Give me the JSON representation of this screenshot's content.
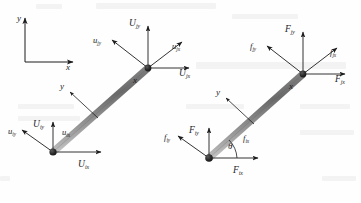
{
  "figure": {
    "type": "structural-element-diagram",
    "background_color": "#fefefe",
    "ink_color": "#1d1d1d",
    "beam_color_dark": "#6b6b6b",
    "beam_color_light": "#d8d8d8"
  },
  "global_axes": {
    "name": "global-coordinate-system",
    "x_label": "x",
    "y_label": "y"
  },
  "left_panel": {
    "name": "displacement-diagram",
    "local_axes": {
      "x_label": "x",
      "y_label": "y"
    },
    "node_j": {
      "name": "upper-node-j",
      "vectors": [
        {
          "id": "Ujy",
          "symbol": "U",
          "sub": "jy",
          "case": "capital",
          "dir": "up"
        },
        {
          "id": "Ujx",
          "symbol": "U",
          "sub": "jx",
          "case": "capital",
          "dir": "right"
        },
        {
          "id": "ujy",
          "symbol": "u",
          "sub": "jy",
          "case": "lower",
          "dir": "up-left"
        },
        {
          "id": "ujx",
          "symbol": "u",
          "sub": "jx",
          "case": "lower",
          "dir": "up-right"
        }
      ]
    },
    "node_i": {
      "name": "lower-node-i",
      "vectors": [
        {
          "id": "Uiy",
          "symbol": "U",
          "sub": "iy",
          "case": "capital",
          "dir": "up"
        },
        {
          "id": "Uix",
          "symbol": "U",
          "sub": "ix",
          "case": "capital",
          "dir": "right"
        },
        {
          "id": "uiy",
          "symbol": "u",
          "sub": "iy",
          "case": "lower",
          "dir": "up-left"
        },
        {
          "id": "uix",
          "symbol": "u",
          "sub": "ix",
          "case": "lower",
          "dir": "up-right"
        }
      ]
    }
  },
  "right_panel": {
    "name": "force-diagram",
    "local_axes": {
      "x_label": "x",
      "y_label": "y"
    },
    "angle": {
      "symbol": "θ",
      "name": "inclination-angle"
    },
    "node_j": {
      "name": "upper-node-j",
      "vectors": [
        {
          "id": "Fjy",
          "symbol": "F",
          "sub": "jy",
          "case": "capital",
          "dir": "up"
        },
        {
          "id": "Fjx",
          "symbol": "F",
          "sub": "jx",
          "case": "capital",
          "dir": "right"
        },
        {
          "id": "fjy",
          "symbol": "f",
          "sub": "jy",
          "case": "lower",
          "dir": "up-left"
        },
        {
          "id": "fjx",
          "symbol": "f",
          "sub": "jx",
          "case": "lower",
          "dir": "up-right"
        }
      ]
    },
    "node_i": {
      "name": "lower-node-i",
      "vectors": [
        {
          "id": "Fiy",
          "symbol": "F",
          "sub": "iy",
          "case": "capital",
          "dir": "up"
        },
        {
          "id": "Fix",
          "symbol": "F",
          "sub": "ix",
          "case": "capital",
          "dir": "right"
        },
        {
          "id": "fiy",
          "symbol": "f",
          "sub": "iy",
          "case": "lower",
          "dir": "up-left"
        },
        {
          "id": "fix",
          "symbol": "f",
          "sub": "ix",
          "case": "lower",
          "dir": "up-right"
        }
      ]
    }
  }
}
